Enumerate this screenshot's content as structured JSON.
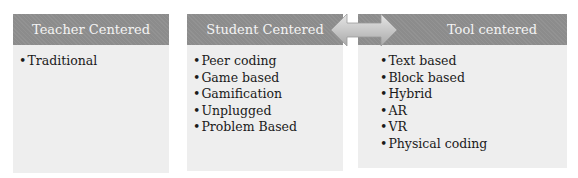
{
  "columns": [
    {
      "title": "Teacher Centered",
      "items": [
        "Traditional"
      ]
    },
    {
      "title": "Student Centered",
      "items": [
        "Peer coding",
        "Game based",
        "Gamification",
        "Unplugged",
        "Problem Based"
      ]
    },
    {
      "title": "Tool centered",
      "items": [
        "Text based",
        "Block based",
        "Hybrid",
        "AR",
        "VR",
        "Physical coding"
      ]
    }
  ],
  "connector": {
    "type": "double-headed-arrow",
    "between": [
      "Student Centered",
      "Tool centered"
    ]
  },
  "colors": {
    "header": "#8c8c8c",
    "body": "#eeeeee",
    "arrow": "#c9c9c9"
  }
}
